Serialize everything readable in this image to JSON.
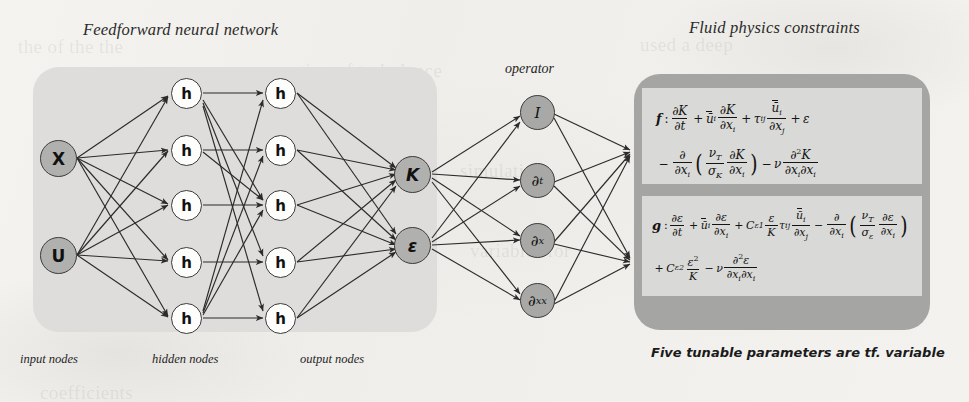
{
  "figure": {
    "left_title": "Feedforward neural network",
    "right_title": "Fluid physics constraints",
    "operator_label": "operator",
    "right_caption": "Five tunable parameters are tf. variable"
  },
  "network": {
    "layer_labels": {
      "input": "input nodes",
      "hidden": "hidden nodes",
      "output": "output nodes"
    },
    "input_nodes": [
      {
        "id": "x",
        "label": "X"
      },
      {
        "id": "u",
        "label": "U"
      }
    ],
    "hidden_layer_1": [
      {
        "label": "h"
      },
      {
        "label": "h"
      },
      {
        "label": "h"
      },
      {
        "label": "h"
      },
      {
        "label": "h"
      }
    ],
    "hidden_layer_2": [
      {
        "label": "h"
      },
      {
        "label": "h"
      },
      {
        "label": "h"
      },
      {
        "label": "h"
      },
      {
        "label": "h"
      }
    ],
    "output_nodes": [
      {
        "id": "k",
        "label": "K"
      },
      {
        "id": "epsilon",
        "label": "ε"
      }
    ],
    "operator_nodes": [
      {
        "id": "identity",
        "base": "I",
        "sub": ""
      },
      {
        "id": "d-t",
        "base": "∂",
        "sub": "t"
      },
      {
        "id": "d-x",
        "base": "∂",
        "sub": "x"
      },
      {
        "id": "d-xx",
        "base": "∂",
        "sub": "xx"
      }
    ]
  },
  "equations": {
    "f": {
      "name": "f",
      "plain": "f: ∂K/∂t + ū_i ∂K/∂x_i + τ_ij ∂ū_i/∂x_j + ε − ∂/∂x_i ( ν_T/σ_K ∂K/∂x_i ) − ν ∂²K/∂x_i∂x_i"
    },
    "g": {
      "name": "g",
      "plain": "g: ∂ε/∂t + ū_i ∂ε/∂x_i + C_ε1 ε/K τ_ij ∂ū_i/∂x_j − ∂/∂x_i ( ν_T/σ_ε ∂ε/∂x_i ) + C_ε2 ε²/K − ν ∂²ε/∂x_i∂x_i"
    }
  },
  "colors": {
    "page_background": "#f2f1ee",
    "left_panel": "#dedddb",
    "right_panel": "#a5a6a4",
    "equation_box": "#d9d9d7",
    "io_node_fill": "#b0b0ae",
    "hidden_node_fill": "#fdfdfc",
    "stroke": "#3b3b3b"
  },
  "ghost_text": [
    "the of the the",
    "tion of turbulence",
    "used a deep",
    "simulation",
    "variables for",
    "coefficients"
  ]
}
